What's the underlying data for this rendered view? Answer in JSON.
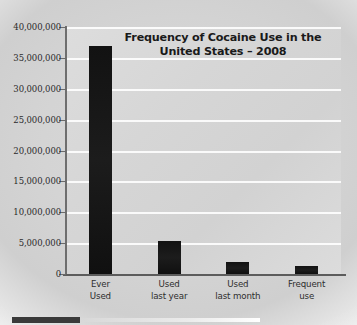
{
  "chart_data": {
    "type": "bar",
    "title": "Frequency of Cocaine Use in the United States – 2008",
    "title_line1": "Frequency of Cocaine Use in the",
    "title_line2": "United States – 2008",
    "xlabel": "",
    "ylabel": "",
    "ylim": [
      0,
      40000000
    ],
    "grid": true,
    "legend": false,
    "categories": [
      "Ever Used",
      "Used last year",
      "Used last month",
      "Frequent use"
    ],
    "category_lines": [
      [
        "Ever",
        "Used"
      ],
      [
        "Used",
        "last year"
      ],
      [
        "Used",
        "last month"
      ],
      [
        "Frequent",
        "use"
      ]
    ],
    "values": [
      37000000,
      5300000,
      1900000,
      1300000
    ],
    "ytick_labels": [
      "40,000,000",
      "35,000,000",
      "30,000,000",
      "25,000,000",
      "20,000,000",
      "15,000,000",
      "10,000,000",
      "5,000,000",
      "0"
    ],
    "ytick_values": [
      40000000,
      35000000,
      30000000,
      25000000,
      20000000,
      15000000,
      10000000,
      5000000,
      0
    ],
    "bar_color": "#141414",
    "plot_background": "#d6d6d6",
    "gridline_color": "#ffffff",
    "axis_color": "#5c5c5c"
  }
}
